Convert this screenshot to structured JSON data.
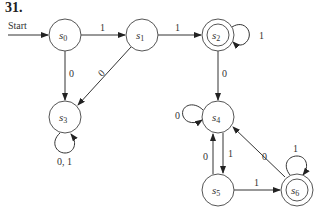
{
  "problem_number": "31.",
  "start_label": "Start",
  "states": [
    {
      "id": "s0",
      "name": "s",
      "sub": "0",
      "x": 65,
      "y": 35,
      "accepting": false
    },
    {
      "id": "s1",
      "name": "s",
      "sub": "1",
      "x": 142,
      "y": 35,
      "accepting": false
    },
    {
      "id": "s2",
      "name": "s",
      "sub": "2",
      "x": 218,
      "y": 35,
      "accepting": true
    },
    {
      "id": "s3",
      "name": "s",
      "sub": "3",
      "x": 65,
      "y": 117,
      "accepting": false
    },
    {
      "id": "s4",
      "name": "s",
      "sub": "4",
      "x": 218,
      "y": 117,
      "accepting": false
    },
    {
      "id": "s5",
      "name": "s",
      "sub": "5",
      "x": 218,
      "y": 190,
      "accepting": false
    },
    {
      "id": "s6",
      "name": "s",
      "sub": "6",
      "x": 297,
      "y": 190,
      "accepting": true
    }
  ],
  "transitions": [
    {
      "from": "s0",
      "to": "s1",
      "label": "1"
    },
    {
      "from": "s0",
      "to": "s3",
      "label": "0"
    },
    {
      "from": "s1",
      "to": "s2",
      "label": "1"
    },
    {
      "from": "s1",
      "to": "s3",
      "label": "0"
    },
    {
      "from": "s2",
      "to": "s2",
      "label": "1"
    },
    {
      "from": "s2",
      "to": "s4",
      "label": "0"
    },
    {
      "from": "s3",
      "to": "s3",
      "label": "0, 1"
    },
    {
      "from": "s4",
      "to": "s4",
      "label": "0"
    },
    {
      "from": "s4",
      "to": "s5",
      "label": "1"
    },
    {
      "from": "s5",
      "to": "s4",
      "label": "0"
    },
    {
      "from": "s5",
      "to": "s6",
      "label": "1"
    },
    {
      "from": "s6",
      "to": "s4",
      "label": "0"
    },
    {
      "from": "s6",
      "to": "s6",
      "label": "1"
    }
  ],
  "labels": {
    "s0_s1": "1",
    "s1_s2": "1",
    "s0_s3": "0",
    "s1_s3": "0",
    "s2_loop": "1",
    "s2_s4": "0",
    "s3_loop": "0, 1",
    "s4_loop": "0",
    "s4_s5": "1",
    "s5_s4": "0",
    "s5_s6": "1",
    "s6_s4": "0",
    "s6_loop": "1"
  }
}
